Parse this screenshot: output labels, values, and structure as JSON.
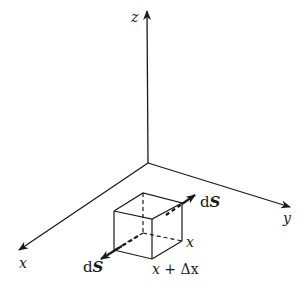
{
  "diagram": {
    "axes": {
      "z": {
        "label": "z"
      },
      "x": {
        "label": "x"
      },
      "y": {
        "label": "y"
      }
    },
    "element": {
      "face_near_label": "x",
      "face_far_label": "x + Δx",
      "face_far_parts": {
        "var": "x",
        "op": "+",
        "delta": "Δx"
      }
    },
    "surface_vectors": [
      {
        "prefix": "d",
        "symbol": "S",
        "position": "upper-right"
      },
      {
        "prefix": "d",
        "symbol": "S",
        "position": "lower-left"
      }
    ],
    "colors": {
      "ink": "#1a1a1a",
      "background": "#ffffff"
    }
  }
}
